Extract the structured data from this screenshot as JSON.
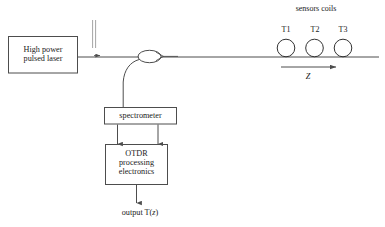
{
  "figure": {
    "type": "optical-fiber-sensing-schematic",
    "background_color": "#ffffff",
    "line_color": "#4d4d4d",
    "text_color": "#1a1a1a"
  },
  "blocks": {
    "laser": {
      "line1": "High power",
      "line2": "pulsed laser"
    },
    "spectrometer": {
      "label": "spectrometer"
    },
    "otdr": {
      "line1": "OTDR",
      "line2": "processing",
      "line3": "electronics"
    }
  },
  "labels": {
    "sensors_coils": "sensors coils",
    "output_prefix": "output T(",
    "output_var": "z",
    "output_suffix": ")",
    "z_axis": "Z"
  },
  "coils": [
    {
      "label": "T1"
    },
    {
      "label": "T2"
    },
    {
      "label": "T3"
    }
  ]
}
